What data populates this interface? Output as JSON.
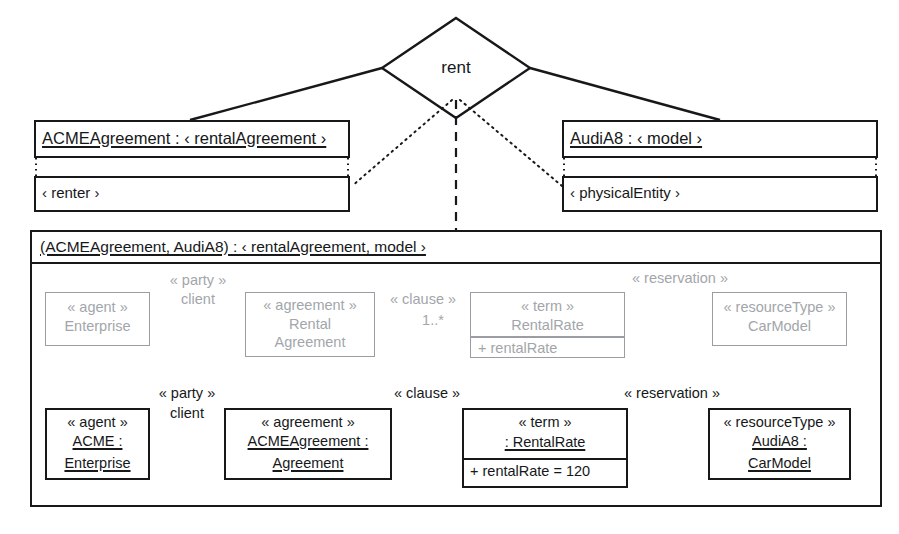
{
  "diagram": {
    "type": "uml-object-and-collaboration-diagram",
    "association": {
      "name": "rent",
      "shape": "diamond"
    },
    "objects": [
      {
        "id": "acme-agreement-object",
        "name": "ACMEAgreement : ‹ rentalAgreement ›",
        "role": "‹ renter ›"
      },
      {
        "id": "audia8-object",
        "name": "AudiA8 : ‹ model ›",
        "role": "‹ physicalEntity ›"
      }
    ],
    "container": {
      "title": "(ACMEAgreement, AudiA8) : ‹ rentalAgreement, model ›"
    },
    "pattern_row": {
      "label": "pattern-level (gray) classes",
      "classes": [
        {
          "id": "pattern-enterprise",
          "stereotype": "« agent »",
          "name_lines": [
            "Enterprise"
          ],
          "attributes": []
        },
        {
          "id": "pattern-rental-agreement",
          "stereotype": "« agreement »",
          "name_lines": [
            "Rental",
            "Agreement"
          ],
          "attributes": []
        },
        {
          "id": "pattern-rental-rate",
          "stereotype": "« term »",
          "name_lines": [
            "RentalRate"
          ],
          "attributes": [
            "+ rentalRate"
          ]
        },
        {
          "id": "pattern-car-model",
          "stereotype": "« resourceType »",
          "name_lines": [
            "CarModel"
          ],
          "attributes": []
        }
      ],
      "edges": [
        {
          "id": "pattern-party-client",
          "lines": [
            "« party »",
            "client"
          ]
        },
        {
          "id": "pattern-clause",
          "lines": [
            "« clause »"
          ],
          "multiplicity": "1..*"
        },
        {
          "id": "pattern-reservation",
          "lines": [
            "« reservation »"
          ]
        }
      ]
    },
    "instance_row": {
      "label": "instance-level (black) objects",
      "classes": [
        {
          "id": "instance-acme-enterprise",
          "stereotype": "« agent »",
          "name_lines": [
            "ACME :",
            "Enterprise"
          ],
          "attributes": []
        },
        {
          "id": "instance-acme-agreement",
          "stereotype": "« agreement »",
          "name_lines": [
            "ACMEAgreement :",
            "Agreement"
          ],
          "attributes": []
        },
        {
          "id": "instance-rental-rate",
          "stereotype": "« term »",
          "name_lines": [
            ": RentalRate"
          ],
          "attributes": [
            "+ rentalRate = 120"
          ]
        },
        {
          "id": "instance-audia8-carmodel",
          "stereotype": "« resourceType »",
          "name_lines": [
            "AudiA8 :",
            "CarModel"
          ],
          "attributes": []
        }
      ],
      "edges": [
        {
          "id": "instance-party-client",
          "lines": [
            "« party »",
            "client"
          ]
        },
        {
          "id": "instance-clause",
          "lines": [
            "« clause »"
          ]
        },
        {
          "id": "instance-reservation",
          "lines": [
            "« reservation »"
          ]
        }
      ]
    },
    "colors": {
      "ink": "#16181a",
      "gray": "#a2a6aa",
      "gray_line": "#9a9ea2",
      "background": "#ffffff"
    }
  }
}
